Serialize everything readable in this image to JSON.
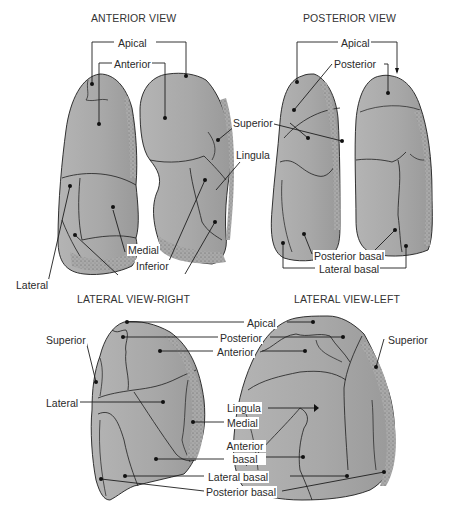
{
  "diagram": {
    "colors": {
      "lobe_fill": "#a9a9a9",
      "lobe_stipple": "#6e6e6e",
      "outline": "#1e1e1e",
      "text": "#2a2a2a",
      "background": "#ffffff"
    },
    "panels": [
      {
        "id": "anterior",
        "title": "ANTERIOR VIEW",
        "labels": [
          "Apical",
          "Anterior",
          "Superior",
          "Lingula",
          "Lateral",
          "Medial",
          "Inferior"
        ]
      },
      {
        "id": "posterior",
        "title": "POSTERIOR VIEW",
        "labels": [
          "Apical",
          "Posterior",
          "Superior",
          "Posterior basal",
          "Lateral basal"
        ]
      },
      {
        "id": "lateral_right",
        "title": "LATERAL VIEW-RIGHT",
        "labels": [
          "Superior",
          "Lateral",
          "Apical",
          "Posterior",
          "Anterior",
          "Medial",
          "Anterior basal",
          "Lateral basal",
          "Posterior basal"
        ]
      },
      {
        "id": "lateral_left",
        "title": "LATERAL VIEW-LEFT",
        "labels": [
          "Superior",
          "Lingula"
        ]
      }
    ]
  },
  "titles": {
    "anterior": "ANTERIOR VIEW",
    "posterior": "POSTERIOR VIEW",
    "lateral_right": "LATERAL VIEW-RIGHT",
    "lateral_left": "LATERAL VIEW-LEFT"
  },
  "labels": {
    "ant_apical": "Apical",
    "ant_anterior": "Anterior",
    "ant_lateral": "Lateral",
    "ant_medial": "Medial",
    "ant_inferior": "Inferior",
    "mid_superior": "Superior",
    "mid_lingula": "Lingula",
    "post_apical": "Apical",
    "post_posterior": "Posterior",
    "post_posterior_basal": "Posterior basal",
    "post_lateral_basal": "Lateral basal",
    "lr_superior": "Superior",
    "lr_lateral": "Lateral",
    "lat_apical": "Apical",
    "lat_posterior": "Posterior",
    "lat_anterior": "Anterior",
    "ll_superior": "Superior",
    "lat_lingula": "Lingula",
    "lat_medial": "Medial",
    "lat_anterior_basal_1": "Anterior",
    "lat_anterior_basal_2": "basal",
    "lat_lateral_basal": "Lateral basal",
    "lat_posterior_basal": "Posterior basal"
  }
}
